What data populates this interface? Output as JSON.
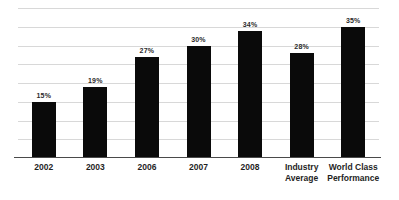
{
  "chart_data": {
    "type": "bar",
    "title": "",
    "subtitle": "",
    "xlabel": "",
    "ylabel": "",
    "categories": [
      "2002",
      "2003",
      "2006",
      "2007",
      "2008",
      "Industry Average",
      "World Class Performance"
    ],
    "category_lines": [
      [
        "2002"
      ],
      [
        "2003"
      ],
      [
        "2006"
      ],
      [
        "2007"
      ],
      [
        "2008"
      ],
      [
        "Industry",
        "Average"
      ],
      [
        "World Class",
        "Performance"
      ]
    ],
    "values": [
      15,
      19,
      27,
      30,
      34,
      28,
      35
    ],
    "value_labels": [
      "15%",
      "19%",
      "27%",
      "30%",
      "34%",
      "28%",
      "35%"
    ],
    "ylim": [
      0,
      40
    ],
    "gridlines": [
      5,
      10,
      15,
      20,
      25,
      30,
      35,
      40
    ],
    "grid": true,
    "legend": false,
    "legend_position": "none",
    "bar_color": "#0a0a0a",
    "gridline_color": "#d8d8d8",
    "axis_color": "#4a4a4a",
    "background_color": "#ffffff",
    "label_color": "#1f1f1f"
  }
}
